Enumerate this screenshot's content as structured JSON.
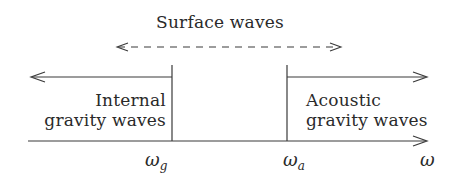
{
  "diagram": {
    "title_label": "Surface waves",
    "regions": {
      "left": {
        "line1": "Internal",
        "line2": "gravity waves"
      },
      "right": {
        "line1": "Acoustic",
        "line2": "gravity waves"
      }
    },
    "axis": {
      "symbol": "ω",
      "ticks": [
        {
          "base": "ω",
          "sub": "g"
        },
        {
          "base": "ω",
          "sub": "a"
        }
      ]
    },
    "colors": {
      "stroke": "#3a3a3a",
      "text": "#2a2a2a",
      "background": "#ffffff"
    }
  }
}
